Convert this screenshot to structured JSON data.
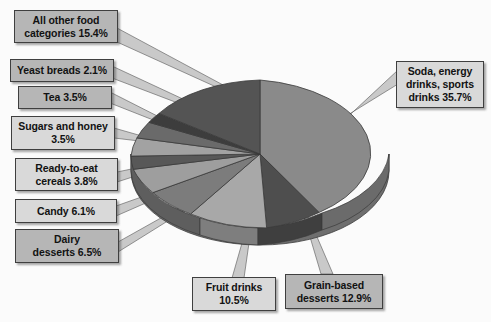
{
  "chart_data": {
    "type": "pie",
    "title": "",
    "legend_position": "callouts",
    "grid": false,
    "units": "percent",
    "categories": [
      "Soda, energy drinks, sports drinks",
      "Grain-based desserts",
      "Fruit drinks",
      "Dairy desserts",
      "Candy",
      "Ready-to-eat cereals",
      "Sugars and honey",
      "Tea",
      "Yeast breads",
      "All other food categories"
    ],
    "values": [
      35.7,
      12.9,
      10.5,
      6.5,
      6.1,
      3.8,
      3.5,
      3.5,
      2.1,
      15.4
    ],
    "slice_colors": [
      "#8a8a8a",
      "#4e4e4e",
      "#a8a8a8",
      "#7c7c7c",
      "#9e9e9e",
      "#585858",
      "#a2a2a2",
      "#6a6a6a",
      "#3d3d3d",
      "#545454"
    ]
  },
  "labels": [
    {
      "name": "all-other-food-categories",
      "line1": "All other food",
      "line2": "categories ",
      "pct": "15.4%",
      "style": "dark"
    },
    {
      "name": "yeast-breads",
      "line1": "Yeast breads ",
      "line2": "",
      "pct": "2.1%",
      "style": "dark"
    },
    {
      "name": "tea",
      "line1": "Tea ",
      "line2": "",
      "pct": "3.5%",
      "style": "dark"
    },
    {
      "name": "sugars-and-honey",
      "line1": "Sugars and honey",
      "line2": "",
      "pct": "3.5%",
      "style": "light"
    },
    {
      "name": "ready-to-eat-cereals",
      "line1": "Ready-to-eat",
      "line2": "cereals ",
      "pct": "3.8%",
      "style": "light"
    },
    {
      "name": "candy",
      "line1": "Candy ",
      "line2": "",
      "pct": "6.1%",
      "style": "light"
    },
    {
      "name": "dairy-desserts",
      "line1": "Dairy",
      "line2": "desserts ",
      "pct": "6.5%",
      "style": "dark"
    },
    {
      "name": "fruit-drinks",
      "line1": "Fruit drinks",
      "line2": "",
      "pct": "10.5%",
      "style": "light"
    },
    {
      "name": "grain-based-desserts",
      "line1": "Grain-based",
      "line2": "desserts ",
      "pct": "12.9%",
      "style": "dark"
    },
    {
      "name": "soda-energy-drinks-sports-drinks",
      "line1": "Soda, energy",
      "line2": "drinks, sports",
      "line3": "drinks ",
      "pct": "35.7%",
      "style": "light"
    }
  ]
}
